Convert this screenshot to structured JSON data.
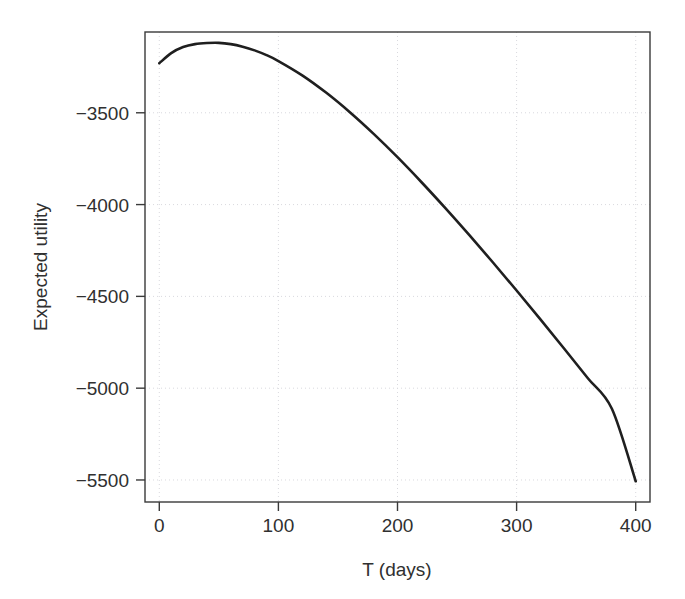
{
  "chart_data": {
    "type": "line",
    "title": "",
    "subtitle": "",
    "xlabel": "T (days)",
    "ylabel": "Expected utility",
    "xlim": [
      -12,
      412
    ],
    "ylim": [
      -5620,
      -3060
    ],
    "grid": true,
    "grid_style": "dotted",
    "legend": "none",
    "line_color": "#1f1f1f",
    "background_color": "#ffffff",
    "xticks": [
      0,
      100,
      200,
      300,
      400
    ],
    "xtick_labels": [
      "0",
      "100",
      "200",
      "300",
      "400"
    ],
    "yticks": [
      -3500,
      -4000,
      -4500,
      -5000,
      -5500
    ],
    "ytick_labels": [
      "−3500",
      "−4000",
      "−4500",
      "−5000",
      "−5500"
    ],
    "annotations": [],
    "series": [
      {
        "name": "Expected utility",
        "x": [
          0,
          10,
          20,
          30,
          40,
          50,
          60,
          70,
          80,
          90,
          100,
          120,
          140,
          160,
          180,
          200,
          220,
          240,
          260,
          280,
          300,
          320,
          340,
          360,
          380,
          400
        ],
        "y": [
          -3230,
          -3175,
          -3142,
          -3126,
          -3120,
          -3119,
          -3126,
          -3140,
          -3160,
          -3186,
          -3218,
          -3296,
          -3390,
          -3497,
          -3615,
          -3742,
          -3877,
          -4018,
          -4164,
          -4314,
          -4468,
          -4625,
          -4785,
          -4947,
          -5112,
          -5507
        ]
      }
    ],
    "peak": {
      "x": 48,
      "y": -3119
    },
    "endpoint": {
      "x": 400,
      "y": -5507
    }
  },
  "geometry": {
    "plot_left": 145,
    "plot_right": 650,
    "plot_top": 32,
    "plot_bottom": 502
  }
}
